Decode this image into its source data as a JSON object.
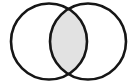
{
  "figure": {
    "name": "venn-diagram-two-sets",
    "type": "venn-diagram",
    "width": 137,
    "height": 84,
    "background_color": "#FFFFFF",
    "stroke_color": "#161616",
    "stroke_width": 2.6,
    "circle_fill_color": "#FFFFFF",
    "intersection_fill_color": "#E2E2E2",
    "labels_visible": false,
    "caption": ""
  },
  "chart_data": {
    "type": "venn",
    "title": "",
    "subtitle": "",
    "xlabel": "",
    "ylabel": "",
    "grid": false,
    "legend": "none",
    "set_count": 2,
    "shaded_regions": [
      "intersection"
    ],
    "unshaded_regions": [
      "left-only",
      "right-only",
      "outside"
    ],
    "sets": [
      {
        "name": "left-set",
        "label": "",
        "center_x": 49,
        "center_y": 41.5,
        "radius": 38,
        "fill": "#FFFFFF",
        "stroke": "#161616"
      },
      {
        "name": "right-set",
        "label": "",
        "center_x": 88,
        "center_y": 41.5,
        "radius": 38,
        "fill": "#FFFFFF",
        "stroke": "#161616"
      }
    ],
    "intersection": {
      "name": "intersection-lens",
      "label": "",
      "fill": "#E2E2E2",
      "crossing_points": [
        [
          68.5,
          8.5
        ],
        [
          68.5,
          74.5
        ]
      ],
      "width_px": 27,
      "height_px": 66
    }
  }
}
